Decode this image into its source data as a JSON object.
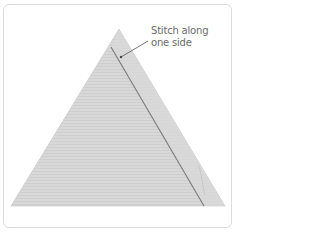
{
  "figure": {
    "annotation": {
      "line1": "Stitch along",
      "line2": "one side"
    },
    "colors": {
      "fabric": "#d6d6d6",
      "fabric_shadow": "#c9c9c9",
      "stitch": "#7a7a7a",
      "frame_border": "#dcdcdc",
      "label_text": "#6b6b6b",
      "leader_line": "#555555"
    }
  }
}
